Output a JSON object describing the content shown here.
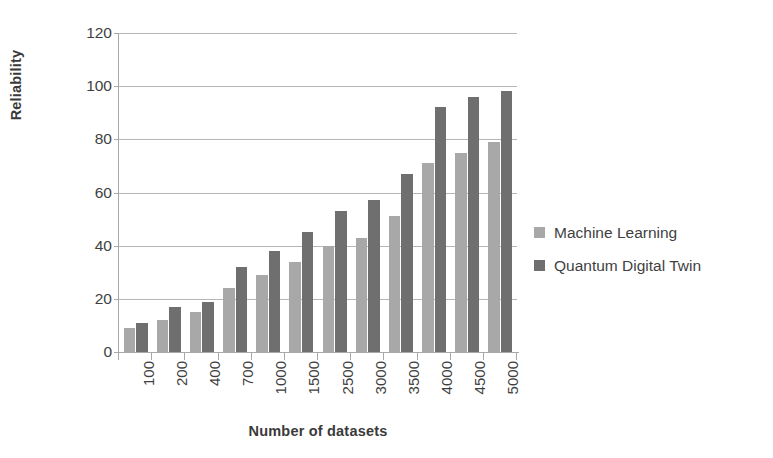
{
  "chart_data": {
    "type": "bar",
    "title": "",
    "subtitle": "",
    "xlabel": "Number of datasets",
    "ylabel": "Reliability",
    "categories": [
      "100",
      "200",
      "400",
      "700",
      "1000",
      "1500",
      "2500",
      "3000",
      "3500",
      "4000",
      "4500",
      "5000"
    ],
    "series": [
      {
        "name": "Machine Learning",
        "color": "#a8a8a8",
        "values": [
          9,
          12,
          15,
          24,
          29,
          34,
          40,
          43,
          51,
          71,
          75,
          79
        ]
      },
      {
        "name": "Quantum Digital Twin",
        "color": "#6f6f6f",
        "values": [
          11,
          17,
          19,
          32,
          38,
          45,
          53,
          57,
          67,
          92,
          96,
          98
        ]
      }
    ],
    "ylim": [
      0,
      120
    ],
    "yticks": [
      0,
      20,
      40,
      60,
      80,
      100,
      120
    ],
    "ytick_labels": [
      "0",
      "20",
      "40",
      "60",
      "80",
      "100",
      "120"
    ],
    "grid": "horizontal",
    "legend_position": "right",
    "xtick_label_rotation": -90,
    "annotations": []
  }
}
